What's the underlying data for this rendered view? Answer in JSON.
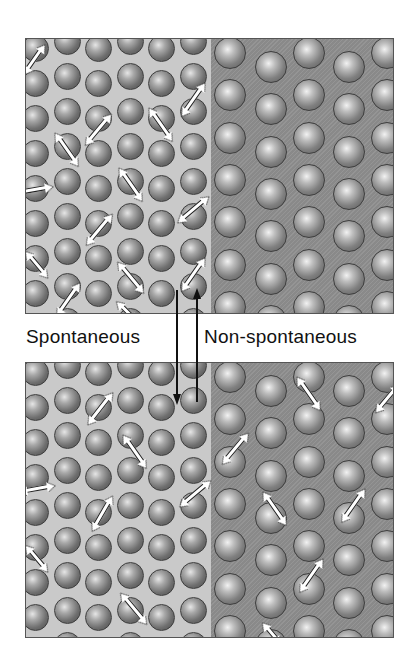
{
  "labels": {
    "spontaneous": "Spontaneous",
    "non_spontaneous": "Non-spontaneous"
  },
  "colors": {
    "hot_region": "#c9c9c9",
    "cold_region": "#8f8f8f",
    "arrow": "#111111",
    "background": "#ffffff"
  },
  "lattice": {
    "light_columns": [
      {
        "x": 9,
        "ys": [
          -5,
          30,
          65,
          100,
          135,
          170,
          205,
          240,
          275
        ]
      },
      {
        "x": 41,
        "ys": [
          -12,
          23,
          58,
          93,
          128,
          163,
          198,
          233,
          268
        ]
      },
      {
        "x": 72,
        "ys": [
          -5,
          30,
          65,
          100,
          135,
          170,
          205,
          240,
          275
        ]
      },
      {
        "x": 104,
        "ys": [
          -12,
          23,
          58,
          93,
          128,
          163,
          198,
          233,
          268
        ]
      },
      {
        "x": 135,
        "ys": [
          -5,
          30,
          65,
          100,
          135,
          170,
          205,
          240,
          275
        ]
      },
      {
        "x": 167,
        "ys": [
          -12,
          23,
          58,
          93,
          128,
          163,
          198,
          233,
          268
        ]
      }
    ],
    "dark_columns": [
      {
        "x": 204,
        "ys": [
          0,
          42,
          85,
          127,
          169,
          212,
          254
        ]
      },
      {
        "x": 245,
        "ys": [
          14,
          56,
          99,
          141,
          183,
          226,
          268
        ]
      },
      {
        "x": 283,
        "ys": [
          0,
          42,
          85,
          127,
          169,
          212,
          254
        ]
      },
      {
        "x": 323,
        "ys": [
          14,
          56,
          99,
          141,
          183,
          226,
          268
        ]
      },
      {
        "x": 361,
        "ys": [
          0,
          42,
          85,
          127,
          169,
          212,
          254
        ]
      }
    ]
  },
  "panels": {
    "before": {
      "name": "initial-state",
      "vibrations": [
        {
          "x": 7,
          "y": 20,
          "angle": -55,
          "len": 22
        },
        {
          "x": 40,
          "y": 110,
          "angle": 55,
          "len": 26
        },
        {
          "x": 71,
          "y": 90,
          "angle": -50,
          "len": 26
        },
        {
          "x": 134,
          "y": 85,
          "angle": 55,
          "len": 26
        },
        {
          "x": 166,
          "y": 60,
          "angle": -55,
          "len": 26
        },
        {
          "x": 104,
          "y": 145,
          "angle": 55,
          "len": 26
        },
        {
          "x": 8,
          "y": 150,
          "angle": -10,
          "len": 22
        },
        {
          "x": 166,
          "y": 170,
          "angle": -40,
          "len": 26
        },
        {
          "x": 72,
          "y": 190,
          "angle": -50,
          "len": 26
        },
        {
          "x": 10,
          "y": 225,
          "angle": 50,
          "len": 20
        },
        {
          "x": 104,
          "y": 238,
          "angle": 50,
          "len": 26
        },
        {
          "x": 166,
          "y": 235,
          "angle": -55,
          "len": 26
        },
        {
          "x": 41,
          "y": 260,
          "angle": -55,
          "len": 26
        },
        {
          "x": 100,
          "y": 272,
          "angle": 45,
          "len": 14
        }
      ]
    },
    "after": {
      "name": "final-state",
      "vibrations": [
        {
          "x": 73,
          "y": 45,
          "angle": -52,
          "len": 26
        },
        {
          "x": 108,
          "y": 88,
          "angle": 55,
          "len": 26
        },
        {
          "x": 10,
          "y": 125,
          "angle": -10,
          "len": 22
        },
        {
          "x": 168,
          "y": 130,
          "angle": -40,
          "len": 26
        },
        {
          "x": 75,
          "y": 150,
          "angle": -60,
          "len": 26
        },
        {
          "x": 10,
          "y": 195,
          "angle": 50,
          "len": 20
        },
        {
          "x": 107,
          "y": 245,
          "angle": 50,
          "len": 26
        },
        {
          "x": 282,
          "y": 30,
          "angle": 55,
          "len": 26
        },
        {
          "x": 360,
          "y": 35,
          "angle": -50,
          "len": 22
        },
        {
          "x": 208,
          "y": 85,
          "angle": -50,
          "len": 26
        },
        {
          "x": 248,
          "y": 145,
          "angle": 55,
          "len": 26
        },
        {
          "x": 326,
          "y": 142,
          "angle": -55,
          "len": 26
        },
        {
          "x": 284,
          "y": 212,
          "angle": -55,
          "len": 26
        },
        {
          "x": 245,
          "y": 270,
          "angle": 50,
          "len": 14
        }
      ]
    }
  }
}
